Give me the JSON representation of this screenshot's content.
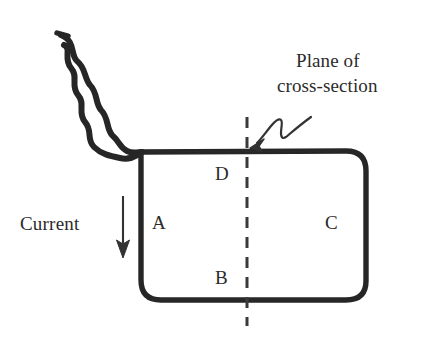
{
  "figure": {
    "background_color": "#ffffff",
    "ink_color": "#2b2b2b",
    "wire_color": "#262626"
  },
  "annotations": {
    "plane_line1": "Plane of",
    "plane_line2": "cross-section",
    "current_label": "Current"
  },
  "node_labels": {
    "a": "A",
    "b": "B",
    "c": "C",
    "d": "D"
  },
  "icons": {
    "twisted_pair_lead": "twisted-wire-icon",
    "current_arrow": "down-arrow-icon",
    "pointer_arrow": "squiggle-arrow-icon",
    "section_plane": "dashed-line-icon",
    "loop": "rounded-rectangle-loop-icon"
  },
  "geometry": {
    "loop_left": 141,
    "loop_right": 366,
    "loop_top": 150,
    "loop_bottom": 300,
    "corner_radius": 20,
    "section_plane_x": 247,
    "section_plane_top": 117,
    "section_plane_bottom": 326,
    "current_arrow_x": 123,
    "current_arrow_top": 196,
    "current_arrow_bottom": 256
  }
}
